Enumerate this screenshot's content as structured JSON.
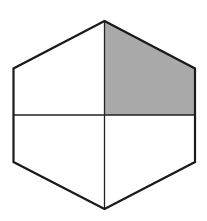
{
  "diagram": {
    "shape": "hexagon",
    "divisions": 4,
    "shaded_parts": 1,
    "shaded_quadrant": "upper-right",
    "colors": {
      "background": "#ffffff",
      "outline": "#1a1a1a",
      "divider": "#222222",
      "shade": "#a9a9a9"
    },
    "vertices": {
      "top": [
        104.5,
        21
      ],
      "upper_right": [
        195,
        68.5
      ],
      "lower_right": [
        195,
        162
      ],
      "bottom": [
        104.5,
        209
      ],
      "lower_left": [
        13.5,
        162
      ],
      "upper_left": [
        13.5,
        68.5
      ]
    },
    "midline_y": 115
  }
}
